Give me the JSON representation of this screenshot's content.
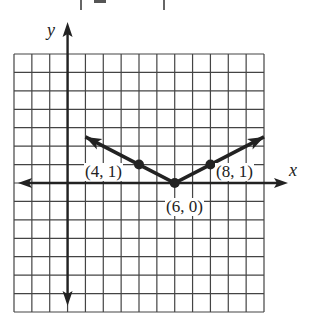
{
  "header_fragment": {
    "text": "2"
  },
  "chart_data": {
    "type": "line",
    "title": "",
    "xlabel": "x",
    "ylabel": "y",
    "xlim": [
      -3,
      11
    ],
    "ylim": [
      -7,
      7
    ],
    "grid": true,
    "grid_step": 1,
    "function_graph": "V-shaped absolute value graph with vertex at (6, 0), arrows at both ends",
    "series": [
      {
        "name": "absolute-value-graph",
        "x": [
          1,
          4,
          6,
          8,
          11
        ],
        "y": [
          2.5,
          1,
          0,
          1,
          2.5
        ]
      }
    ],
    "points": [
      {
        "label": "(4, 1)",
        "x": 4,
        "y": 1
      },
      {
        "label": "(6, 0)",
        "x": 6,
        "y": 0
      },
      {
        "label": "(8, 1)",
        "x": 8,
        "y": 1
      }
    ]
  },
  "labels": {
    "p1": "(4, 1)",
    "p2": "(6, 0)",
    "p3": "(8, 1)",
    "x_axis": "x",
    "y_axis": "y"
  },
  "style": {
    "ink": "#222222",
    "grid": "#444444"
  }
}
